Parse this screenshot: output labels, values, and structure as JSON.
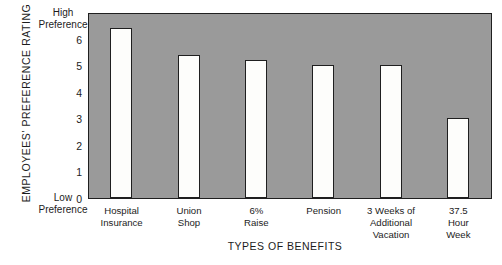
{
  "chart_data": {
    "type": "bar",
    "title": "",
    "categories": [
      "Hospital Insurance",
      "Union Shop",
      "6% Raise",
      "Pension",
      "3 Weeks of Additional Vacation",
      "37.5 Hour Week"
    ],
    "category_lines": [
      [
        "Hospital",
        "Insurance"
      ],
      [
        "Union",
        "Shop"
      ],
      [
        "6%",
        "Raise"
      ],
      [
        "Pension"
      ],
      [
        "3 Weeks of",
        "Additional",
        "Vacation"
      ],
      [
        "37.5",
        "Hour",
        "Week"
      ]
    ],
    "values": [
      6.4,
      5.4,
      5.2,
      5.0,
      5.0,
      3.0
    ],
    "xlabel": "TYPES OF BENEFITS",
    "ylabel": "EMPLOYEES' PREFERENCE RATING",
    "ylim": [
      0,
      7
    ],
    "yticks": [
      0,
      1,
      2,
      3,
      4,
      5,
      6
    ],
    "ytick_labels": [
      "0",
      "1",
      "2",
      "3",
      "4",
      "5",
      "6"
    ],
    "y_axis_top_caption": [
      "High",
      "Preference"
    ],
    "y_axis_bottom_caption": [
      "Low",
      "Preference"
    ],
    "grid": false,
    "legend": null,
    "plot_background_color": "#9a9a9a",
    "bar_fill_color": "#fdfdfb",
    "bar_edge_color": "#1f1f1f",
    "axis_color": "#1f1f1f",
    "text_color": "#1c1c1c"
  }
}
